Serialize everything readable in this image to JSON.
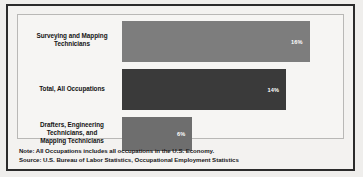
{
  "chart_data": {
    "type": "bar",
    "orientation": "horizontal",
    "title": "",
    "subtitle": "",
    "xlabel": "",
    "ylabel": "",
    "grid": false,
    "legend": null,
    "xlim": [
      0,
      18
    ],
    "value_suffix": "%",
    "categories": [
      "Surveying and Mapping Technicians",
      "Total, All Occupations",
      "Drafters, Engineering Technicians, and Mapping Technicians"
    ],
    "values": [
      16,
      14,
      6
    ],
    "value_labels": [
      "16%",
      "14%",
      "6%"
    ],
    "bar_colors": [
      "#7d7d7d",
      "#3a3a3a",
      "#6e6e6e"
    ],
    "bars": [
      {
        "label_lines": [
          "Surveying and Mapping",
          "Technicians"
        ],
        "value": 16,
        "value_label": "16%",
        "color": "#7d7d7d"
      },
      {
        "label_lines": [
          "Total, All Occupations"
        ],
        "value": 14,
        "value_label": "14%",
        "color": "#3a3a3a"
      },
      {
        "label_lines": [
          "Drafters, Engineering",
          "Technicians, and",
          "Mapping Technicians"
        ],
        "value": 6,
        "value_label": "6%",
        "color": "#6e6e6e"
      }
    ],
    "annotations": [
      "Note: All Occupations includes all occupations in the U.S. Economy.",
      "Source: U.S. Bureau of Labor Statistics, Occupational Employment Statistics"
    ]
  },
  "notes": {
    "note": "Note: All Occupations includes all occupations in the U.S. Economy.",
    "source": "Source: U.S. Bureau of Labor Statistics, Occupational Employment Statistics"
  },
  "colors": {
    "frame_border": "#2b2b2b",
    "plot_border": "#b9b8b6",
    "background": "#f3f2f0",
    "value_text": "#ffffff",
    "label_text": "#141414"
  }
}
